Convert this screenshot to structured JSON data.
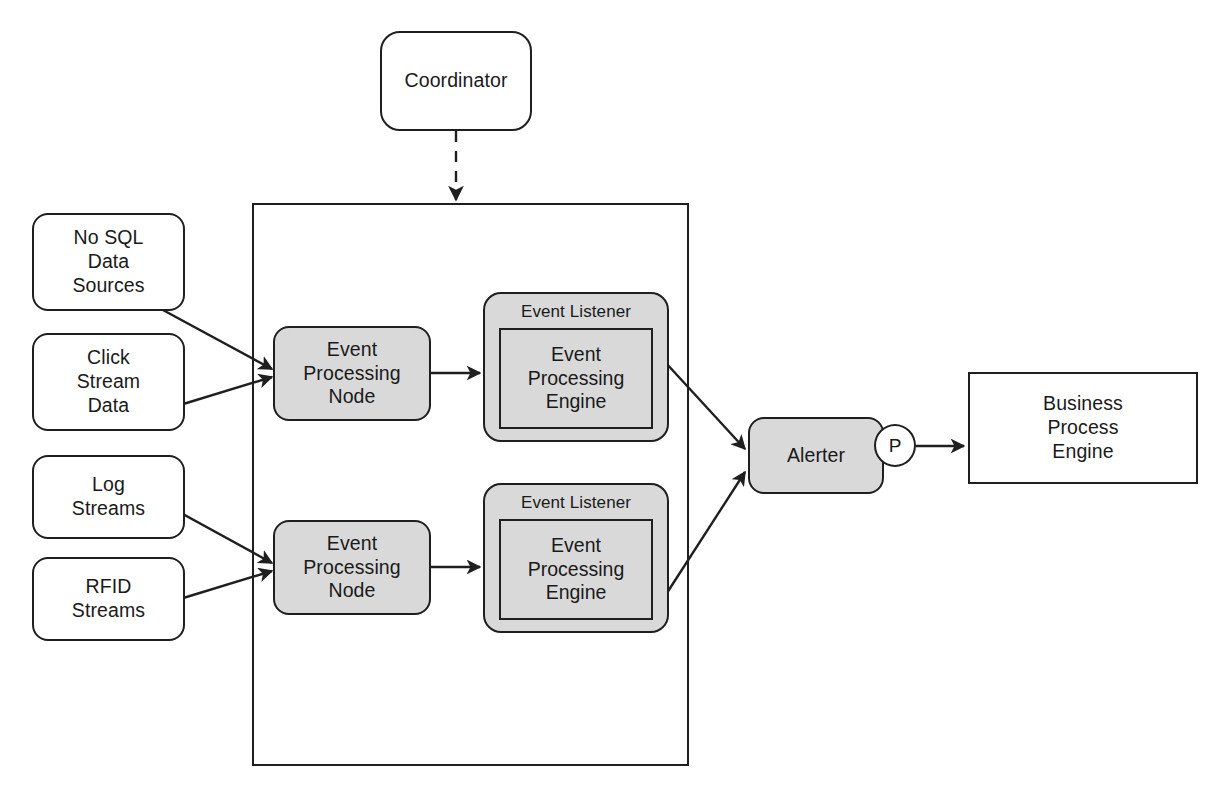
{
  "diagram": {
    "colors": {
      "stroke": "#1f1f1f",
      "fill_gray": "#d9d9d9",
      "fill_white": "#ffffff",
      "background": "#ffffff"
    },
    "coordinator": {
      "label": "Coordinator",
      "shape": "rounded-rectangle",
      "fill": "#ffffff"
    },
    "container": {
      "label": "",
      "shape": "rectangle",
      "fill": "transparent"
    },
    "sources": [
      {
        "label": "No SQL\nData\nSources",
        "shape": "rounded-rectangle",
        "fill": "#ffffff"
      },
      {
        "label": "Click\nStream\nData",
        "shape": "rounded-rectangle",
        "fill": "#ffffff"
      },
      {
        "label": "Log\nStreams",
        "shape": "rounded-rectangle",
        "fill": "#ffffff"
      },
      {
        "label": "RFID\nStreams",
        "shape": "rounded-rectangle",
        "fill": "#ffffff"
      }
    ],
    "processing_nodes": [
      {
        "label": "Event\nProcessing\nNode",
        "shape": "rounded-rectangle",
        "fill": "#d9d9d9"
      },
      {
        "label": "Event\nProcessing\nNode",
        "shape": "rounded-rectangle",
        "fill": "#d9d9d9"
      }
    ],
    "listeners": [
      {
        "title": "Event Listener",
        "engine_label": "Event\nProcessing\nEngine",
        "shape": "rounded-rectangle",
        "fill": "#d9d9d9"
      },
      {
        "title": "Event Listener",
        "engine_label": "Event\nProcessing\nEngine",
        "shape": "rounded-rectangle",
        "fill": "#d9d9d9"
      }
    ],
    "alerter": {
      "label": "Alerter",
      "port_label": "P",
      "shape": "rounded-rectangle",
      "fill": "#d9d9d9"
    },
    "business_process_engine": {
      "label": "Business\nProcess\nEngine",
      "shape": "rectangle",
      "fill": "#ffffff"
    },
    "edges": [
      {
        "from": "Coordinator",
        "to": "container",
        "style": "dashed",
        "arrow": "filled-triangle"
      },
      {
        "from": "No SQL Data Sources",
        "to": "Event Processing Node (upper)",
        "style": "solid",
        "arrow": "filled-triangle"
      },
      {
        "from": "Click Stream Data",
        "to": "Event Processing Node (upper)",
        "style": "solid",
        "arrow": "filled-triangle"
      },
      {
        "from": "Log Streams",
        "to": "Event Processing Node (lower)",
        "style": "solid",
        "arrow": "filled-triangle"
      },
      {
        "from": "RFID Streams",
        "to": "Event Processing Node (lower)",
        "style": "solid",
        "arrow": "filled-triangle"
      },
      {
        "from": "Event Processing Node (upper)",
        "to": "Event Listener (upper)",
        "style": "solid",
        "arrow": "filled-triangle"
      },
      {
        "from": "Event Processing Node (lower)",
        "to": "Event Listener (lower)",
        "style": "solid",
        "arrow": "filled-triangle"
      },
      {
        "from": "Event Listener (upper)",
        "to": "Alerter",
        "style": "solid",
        "arrow": "filled-triangle"
      },
      {
        "from": "Event Listener (lower)",
        "to": "Alerter",
        "style": "solid",
        "arrow": "filled-triangle"
      },
      {
        "from": "Alerter P port",
        "to": "Business Process Engine",
        "style": "solid",
        "arrow": "filled-triangle"
      }
    ]
  }
}
